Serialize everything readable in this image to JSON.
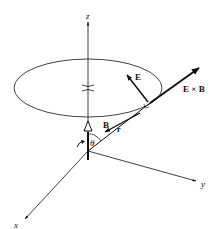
{
  "figure": {
    "axes": {
      "z_label": "z",
      "y_label": "y",
      "x_label": "x"
    },
    "labels": {
      "E": "E",
      "ExB": "E × B",
      "B": "B",
      "r": "r",
      "theta": "θ"
    },
    "colors": {
      "ink": "#111111",
      "background": "#ffffff"
    }
  }
}
